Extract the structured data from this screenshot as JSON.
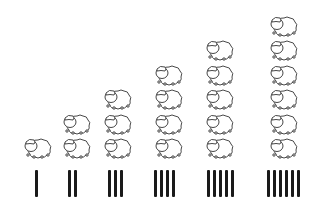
{
  "colors": {
    "outline": "#333333",
    "tally": "#1a1a1a",
    "background": "#ffffff"
  },
  "columns": [
    {
      "count": 1,
      "sheep": 1,
      "tally_marks": 1,
      "x": 22,
      "tally_x": 35
    },
    {
      "count": 2,
      "sheep": 2,
      "tally_marks": 2,
      "x": 61,
      "tally_x": 68
    },
    {
      "count": 3,
      "sheep": 3,
      "tally_marks": 3,
      "x": 102,
      "tally_x": 108
    },
    {
      "count": 4,
      "sheep": 4,
      "tally_marks": 4,
      "x": 153,
      "tally_x": 154
    },
    {
      "count": 5,
      "sheep": 5,
      "tally_marks": 5,
      "x": 204,
      "tally_x": 207
    },
    {
      "count": 6,
      "sheep": 6,
      "tally_marks": 6,
      "x": 268,
      "tally_x": 267
    }
  ]
}
